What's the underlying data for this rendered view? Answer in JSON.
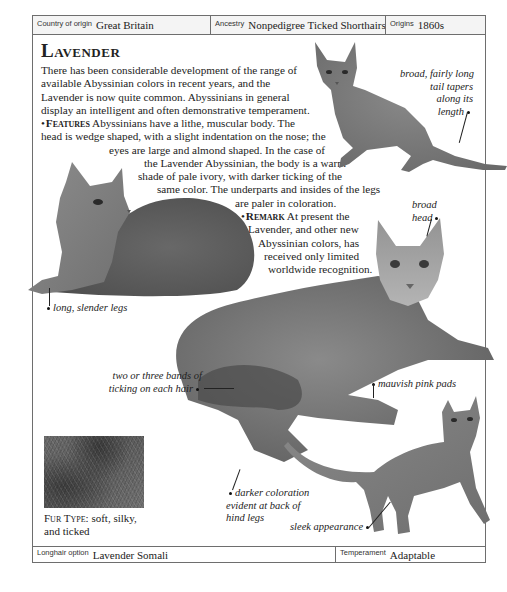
{
  "header": {
    "country_label": "Country of origin",
    "country_value": "Great Britain",
    "ancestry_label": "Ancestry",
    "ancestry_value": "Nonpedigree Ticked Shorthairs",
    "origins_label": "Origins",
    "origins_value": "1860s"
  },
  "title": "Lavender",
  "intro": {
    "line1": "There has been considerable development of the range of",
    "line2": "available Abyssinian colors in recent years, and the",
    "line3": "Lavender is now quite common. Abyssinians in general",
    "line4": "display an intelligent and often demonstrative temperament."
  },
  "features": {
    "heading": "Features",
    "line1": "Abyssinians have a lithe, muscular body. The",
    "line2": "head is wedge shaped, with a slight indentation on the nose; the",
    "line3": "eyes are large and almond shaped. In the case of",
    "line4": "the Lavender Abyssinian, the body is a warm",
    "line5": "shade of pale ivory, with darker ticking of the",
    "line6": "same color. The underparts and insides of the legs",
    "line7": "are paler in coloration."
  },
  "remark": {
    "heading": "Remark",
    "line1": "At present the",
    "line2": "Lavender, and other new",
    "line3": "Abyssinian colors, has",
    "line4": "received only limited",
    "line5": "worldwide recognition."
  },
  "annotations": {
    "tail": [
      "broad, fairly long",
      "tail tapers",
      "along its",
      "length"
    ],
    "head": [
      "broad",
      "head"
    ],
    "legs": "long, slender legs",
    "ticking": [
      "two or three bands of",
      "ticking on each hair"
    ],
    "pads": "mauvish pink pads",
    "hind": [
      "darker coloration",
      "evident at back of",
      "hind legs"
    ],
    "sleek": "sleek appearance"
  },
  "fur_type": {
    "label": "Fur Type:",
    "line1": "soft, silky,",
    "line2": "and ticked"
  },
  "footer": {
    "longhair_label": "Longhair option",
    "longhair_value": "Lavender Somali",
    "temperament_label": "Temperament",
    "temperament_value": "Adaptable"
  },
  "colors": {
    "border": "#6e6e6e",
    "header_bg": "#f4f4f4",
    "cat_gray": "#7a7a7a"
  }
}
